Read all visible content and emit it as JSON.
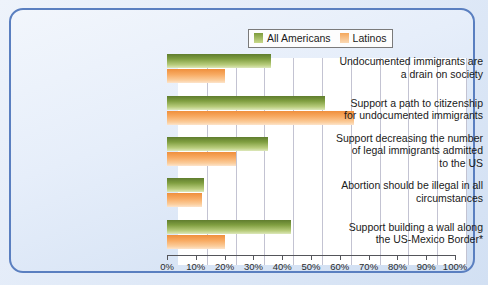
{
  "chart_data": {
    "type": "bar",
    "orientation": "horizontal",
    "title": "",
    "xlabel": "",
    "ylabel": "",
    "xlim": [
      0,
      100
    ],
    "xticks": [
      "0%",
      "10%",
      "20%",
      "30%",
      "40%",
      "50%",
      "60%",
      "70%",
      "80%",
      "90%",
      "100%"
    ],
    "xtick_values": [
      0,
      10,
      20,
      30,
      40,
      50,
      60,
      70,
      80,
      90,
      100
    ],
    "grid": true,
    "legend_position": "top-right",
    "categories": [
      "Undocumented immigrants are a drain on society",
      "Support a path to citizenship for undocumented immigrants",
      "Support decreasing the number of legal immigrants admitted to the US",
      "Abortion should be illegal in all circumstances",
      "Support building a wall along the US-Mexico Border*"
    ],
    "category_lines": [
      [
        "Undocumented immigrants are",
        "a drain on society"
      ],
      [
        "Support a path to citizenship",
        "for undocumented immigrants"
      ],
      [
        "Support decreasing the number",
        "of legal immigrants admitted",
        "to the US"
      ],
      [
        "Abortion should be illegal in all",
        "circumstances"
      ],
      [
        "Support building a wall along",
        "the US-Mexico Border*"
      ]
    ],
    "series": [
      {
        "name": "All Americans",
        "color": "#7f9e40",
        "values": [
          36,
          55,
          35,
          13,
          43
        ]
      },
      {
        "name": "Latinos",
        "color": "#f8ab63",
        "values": [
          20,
          65,
          24,
          12,
          20
        ]
      }
    ]
  },
  "legend": {
    "items": [
      {
        "label": "All Americans",
        "swatch": "green"
      },
      {
        "label": "Latinos",
        "swatch": "orange"
      }
    ]
  },
  "colors": {
    "panel_border": "#5a7fc0",
    "green": "#7f9e40",
    "orange": "#f8ab63",
    "plot_background": "#ffffff",
    "gridline": "#c3c3d2"
  }
}
